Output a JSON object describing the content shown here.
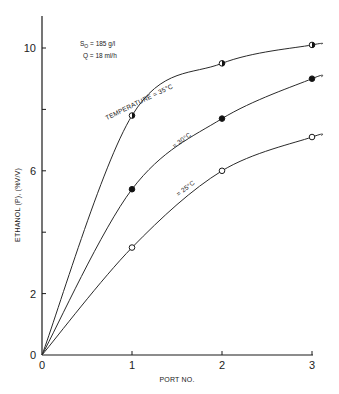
{
  "chart_data": {
    "type": "line",
    "title": "",
    "xlabel": "PORT NO.",
    "ylabel": "ETHANOL (P), (%V/V)",
    "x": [
      0,
      1,
      2,
      3
    ],
    "xlim": [
      0,
      3
    ],
    "ylim": [
      0,
      11
    ],
    "x_ticks": [
      0,
      1,
      2,
      3
    ],
    "x_tick_labels": [
      "0",
      "1",
      "2",
      "3"
    ],
    "y_ticks": [
      0,
      2,
      4,
      6,
      8,
      10
    ],
    "y_tick_labels": [
      "0",
      "2",
      "",
      "6",
      "",
      "10"
    ],
    "grid": false,
    "annotations": [
      {
        "text": "S",
        "subscript": "O",
        "rest": " = 185 g/l"
      },
      {
        "text": "Q = 18 ml/h"
      }
    ],
    "series": [
      {
        "name": "TEMPERATURE = 35°C",
        "marker": "half-filled-circle",
        "values": [
          0,
          7.8,
          9.5,
          10.1
        ]
      },
      {
        "name": "= 30°C",
        "marker": "filled-circle",
        "values": [
          0,
          5.4,
          7.7,
          9.0
        ]
      },
      {
        "name": "= 25°C",
        "marker": "open-circle",
        "values": [
          0,
          3.5,
          6.0,
          7.1
        ]
      }
    ]
  }
}
